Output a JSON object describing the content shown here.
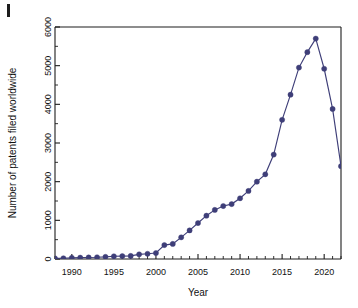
{
  "figure": {
    "corner_mark_label": "",
    "background_color": "#ffffff",
    "series_color": "#3e3e78",
    "axis_color": "#1d1d1d"
  },
  "chart_data": {
    "type": "line",
    "title": "",
    "subtitle": "",
    "xlabel": "Year",
    "ylabel": "Number of patents filed worldwide",
    "xlim": [
      1988,
      2022
    ],
    "ylim": [
      0,
      6000
    ],
    "grid": false,
    "legend": null,
    "legend_position": "none",
    "xticks": [
      1990,
      1995,
      2000,
      2005,
      2010,
      2015,
      2020
    ],
    "xtick_labels": [
      "1990",
      "1995",
      "2000",
      "2005",
      "2010",
      "2015",
      "2020"
    ],
    "x_minor_tick_interval": 1,
    "yticks": [
      0,
      1000,
      2000,
      3000,
      4000,
      5000,
      6000
    ],
    "ytick_labels": [
      "0",
      "1000",
      "2000",
      "3000",
      "4000",
      "5000",
      "6000"
    ],
    "y_minor_tick_interval": 500,
    "marker": "circle",
    "x": [
      1988,
      1989,
      1990,
      1991,
      1992,
      1993,
      1994,
      1995,
      1996,
      1997,
      1998,
      1999,
      2000,
      2001,
      2002,
      2003,
      2004,
      2005,
      2006,
      2007,
      2008,
      2009,
      2010,
      2011,
      2012,
      2013,
      2014,
      2015,
      2016,
      2017,
      2018,
      2019,
      2020,
      2021,
      2022
    ],
    "values": [
      15,
      20,
      30,
      35,
      40,
      45,
      55,
      70,
      75,
      80,
      120,
      135,
      155,
      360,
      390,
      560,
      740,
      930,
      1120,
      1270,
      1370,
      1420,
      1570,
      1760,
      2000,
      2190,
      2700,
      3600,
      4250,
      4950,
      5350,
      5700,
      4920,
      3880,
      2400
    ],
    "series": [
      {
        "name": "Patents filed worldwide",
        "color": "#3e3e78",
        "values": [
          15,
          20,
          30,
          35,
          40,
          45,
          55,
          70,
          75,
          80,
          120,
          135,
          155,
          360,
          390,
          560,
          740,
          930,
          1120,
          1270,
          1370,
          1420,
          1570,
          1760,
          2000,
          2190,
          2700,
          3600,
          4250,
          4950,
          5350,
          5700,
          4920,
          3880,
          2400
        ]
      }
    ]
  }
}
